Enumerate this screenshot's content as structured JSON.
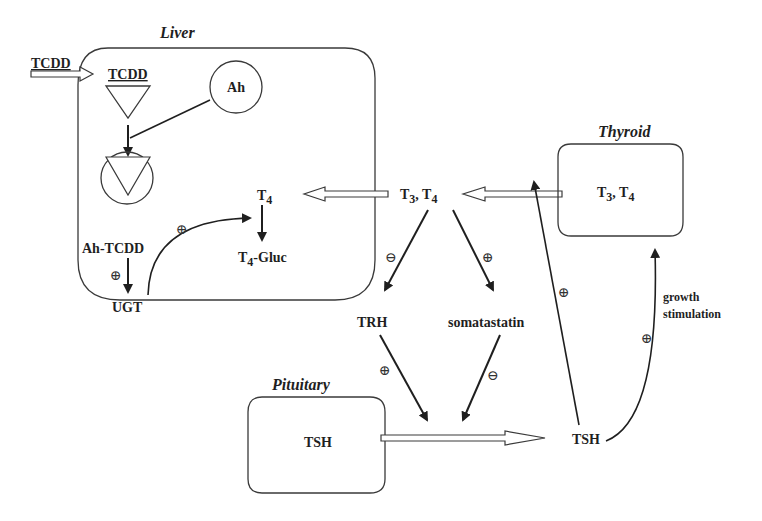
{
  "compartments": {
    "liver": {
      "title": "Liver"
    },
    "thyroid": {
      "title": "Thyroid",
      "content": "T3, T4"
    },
    "pituitary": {
      "title": "Pituitary",
      "content": "TSH"
    }
  },
  "labels": {
    "tcdd_input": "TCDD",
    "tcdd_ligand": "TCDD",
    "ah_receptor": "Ah",
    "ah_tcdd": "Ah-TCDD",
    "ugt": "UGT",
    "t4_liver": "T",
    "t4_liver_sub": "4",
    "t4_gluc": "T",
    "t4_gluc_sub": "4",
    "t4_gluc_suffix": "-Gluc",
    "t3_center": "T",
    "t3_center_sub": "3",
    "t4_center": "T",
    "t4_center_sub": "4",
    "thyroid_t3": "T",
    "thyroid_t3_sub": "3",
    "thyroid_t4": "T",
    "thyroid_t4_sub": "4",
    "trh": "TRH",
    "somatostatin": "somatastatin",
    "tsh_pituitary": "TSH",
    "tsh_circulating": "TSH",
    "growth_line1": "growth",
    "growth_line2": "stimulation"
  },
  "signs": {
    "positive": "⊕",
    "negative": "⊖"
  },
  "effects": [
    {
      "from": "Ah-TCDD",
      "to": "UGT",
      "sign": "positive"
    },
    {
      "from": "UGT",
      "to": "T4 glucuronidation",
      "sign": "positive"
    },
    {
      "from": "T3, T4",
      "to": "TRH",
      "sign": "negative"
    },
    {
      "from": "T3, T4",
      "to": "somatastatin",
      "sign": "positive"
    },
    {
      "from": "TRH",
      "to": "TSH release",
      "sign": "positive"
    },
    {
      "from": "somatastatin",
      "to": "TSH release",
      "sign": "negative"
    },
    {
      "from": "TSH",
      "to": "T3, T4 secretion",
      "sign": "positive"
    },
    {
      "from": "TSH",
      "to": "Thyroid growth stimulation",
      "sign": "positive"
    }
  ]
}
